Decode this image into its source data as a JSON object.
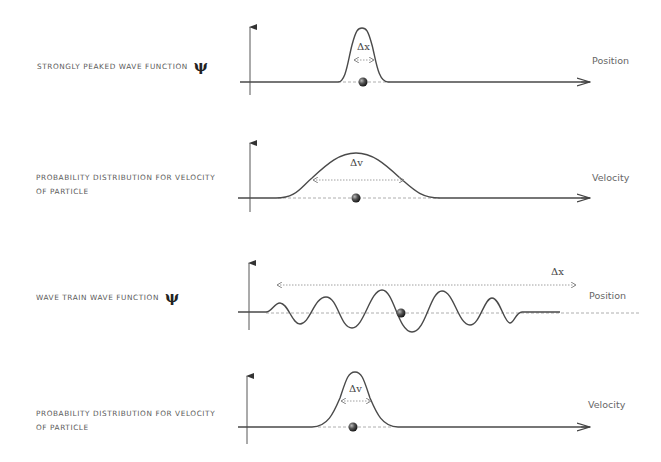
{
  "panels": [
    {
      "id": "peaked-wave-function",
      "title": "STRONGLY PEAKED WAVE FUNCTION",
      "symbol": "ψ",
      "axis_label": "Position",
      "width_label": "Δx"
    },
    {
      "id": "velocity-distribution-broad",
      "title_line1": "PROBABILITY DISTRIBUTION FOR VELOCITY",
      "title_line2": "OF PARTICLE",
      "axis_label": "Velocity",
      "width_label": "Δv"
    },
    {
      "id": "wave-train-wave-function",
      "title": "WAVE TRAIN WAVE FUNCTION",
      "symbol": "ψ",
      "axis_label": "Position",
      "width_label": "Δx"
    },
    {
      "id": "velocity-distribution-narrow",
      "title_line1": "PROBABILITY DISTRIBUTION FOR VELOCITY",
      "title_line2": "OF PARTICLE",
      "axis_label": "Velocity",
      "width_label": "Δv"
    }
  ],
  "colors": {
    "curve": "#4a4a4a",
    "axis": "#444444",
    "dashed": "#9a9a9a",
    "text": "#5a5a5a",
    "particle": "#333333"
  }
}
